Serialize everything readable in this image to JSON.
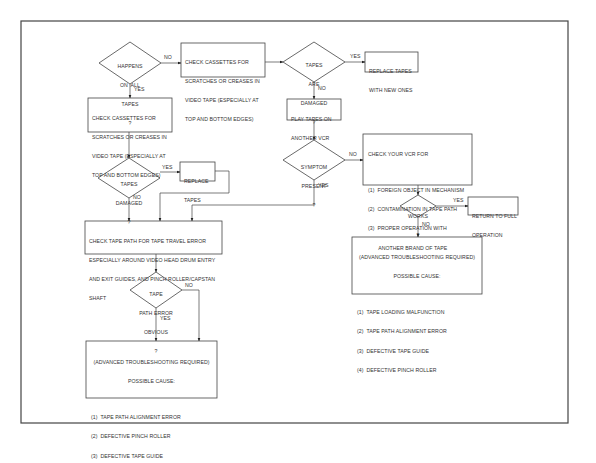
{
  "flowchart": {
    "frame": {
      "color": "#444444"
    },
    "nodes": {
      "d_all_tapes": {
        "type": "decision",
        "lines": [
          "HAPPENS",
          "ON  ALL",
          "TAPES",
          "?"
        ]
      },
      "b_check_cassettes_top": {
        "type": "process",
        "lines": [
          "CHECK CASSETTES FOR",
          "SCRATCHES OR CREASES IN",
          "VIDEO TAPE (ESPECIALLY AT",
          "TOP AND BOTTOM EDGES)"
        ]
      },
      "d_tapes_are_damaged": {
        "type": "decision",
        "lines": [
          "TAPES",
          "ARE",
          "DAMAGED",
          "?"
        ]
      },
      "b_replace_new": {
        "type": "process",
        "lines": [
          "REPLACE TAPES",
          "WITH NEW ONES"
        ]
      },
      "b_play_another": {
        "type": "process",
        "lines": [
          "PLAY TAPES ON",
          "ANOTHER VCR"
        ]
      },
      "d_symptom": {
        "type": "decision",
        "lines": [
          "SYMPTOM",
          "PRESENT",
          "?"
        ]
      },
      "b_check_vcr": {
        "type": "process",
        "title": "CHECK YOUR VCR FOR",
        "items": [
          "(1)  FOREIGN OBJECT IN MECHANISM",
          "(2)  CONTAMINATION IN TAPE PATH",
          "(3)  PROPER OPERATION WITH",
          "       ANOTHER BRAND OF TAPE"
        ]
      },
      "d_works": {
        "type": "decision",
        "lines": [
          "WORKS",
          "?"
        ]
      },
      "b_return": {
        "type": "terminal",
        "lines": [
          "RETURN TO FULL",
          "OPERATION"
        ]
      },
      "b_advanced_right": {
        "type": "result",
        "header": [
          "(ADVANCED TROUBLESHOOTING REQUIRED)",
          "POSSIBLE CAUSE:"
        ],
        "items": [
          "(1)  TAPE LOADING MALFUNCTION",
          "(2)  TAPE PATH ALIGNMENT ERROR",
          "(3)  DEFECTIVE TAPE GUIDE",
          "(4)  DEFECTIVE PINCH ROLLER"
        ]
      },
      "b_check_cassettes_left": {
        "type": "process",
        "lines": [
          "CHECK CASSETTES FOR",
          "SCRATCHES OR CREASES IN",
          "VIDEO TAPE (ESPECIALLY AT",
          "TOP AND BOTTOM EDGES)"
        ]
      },
      "d_tapes_damaged": {
        "type": "decision",
        "lines": [
          "TAPES",
          "DAMAGED",
          "?"
        ]
      },
      "b_replace_tapes": {
        "type": "process",
        "lines": [
          "REPLACE",
          "TAPES"
        ]
      },
      "b_check_tape_path": {
        "type": "process",
        "lines": [
          "CHECK TAPE PATH FOR TAPE TRAVEL ERROR",
          "ESPECIALLY AROUND VIDEO HEAD DRUM ENTRY",
          "AND EXIT GUIDES, AND PINCH ROLLER/CAPSTAN",
          "SHAFT"
        ]
      },
      "d_path_error": {
        "type": "decision",
        "lines": [
          "TAPE",
          "PATH ERROR",
          "OBVIOUS",
          "?"
        ]
      },
      "b_advanced_left": {
        "type": "result",
        "header": [
          "(ADVANCED TROUBLESHOOTING REQUIRED)",
          "POSSIBLE CAUSE:"
        ],
        "items": [
          "(1)  TAPE PATH ALIGNMENT ERROR",
          "(2)  DEFECTIVE PINCH ROLLER",
          "(3)  DEFECTIVE TAPE GUIDE"
        ]
      }
    },
    "edge_labels": {
      "all_no": "NO",
      "all_yes": "YES",
      "damaged_yes": "YES",
      "damaged_no": "NO",
      "symptom_no": "NO",
      "symptom_yes": "YES",
      "works_yes": "YES",
      "works_no": "NO",
      "left_damaged_yes": "YES",
      "left_damaged_no": "NO",
      "path_no": "NO",
      "path_yes": "YES"
    }
  }
}
